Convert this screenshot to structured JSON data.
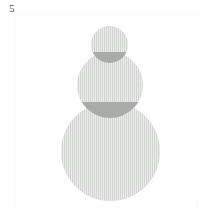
{
  "figure": {
    "panel_label": "5",
    "background_color": "#ffffff",
    "frame_color": "#fbfbfb",
    "width": 214,
    "height": 223
  },
  "chart_data": {
    "type": "scatter",
    "title": "",
    "subtitle": "",
    "xlabel": "",
    "ylabel": "",
    "grid": false,
    "legend": null,
    "annotations": [
      "5"
    ],
    "shape": "circle",
    "shape_count": 3,
    "fill_color": "#d2d4d2",
    "overlap_color": "#a9aba9",
    "texture": "vertical-hatch",
    "circles": [
      {
        "name": "small-disc",
        "cx": 109.5,
        "cy": 44.5,
        "r": 18.5,
        "diameter": 37,
        "fill": "#d2d4d2"
      },
      {
        "name": "medium-disc",
        "cx": 110.0,
        "cy": 85.0,
        "r": 33.0,
        "diameter": 66,
        "fill": "#d2d4d2"
      },
      {
        "name": "large-disc",
        "cx": 110.5,
        "cy": 151.5,
        "r": 49.5,
        "diameter": 99,
        "fill": "#d2d4d2"
      }
    ],
    "overlaps": [
      {
        "name": "small-medium-lens",
        "between": [
          "small-disc",
          "medium-disc"
        ],
        "fill": "#a9aba9"
      },
      {
        "name": "medium-large-lens",
        "between": [
          "medium-disc",
          "large-disc"
        ],
        "fill": "#a9aba9"
      }
    ]
  }
}
